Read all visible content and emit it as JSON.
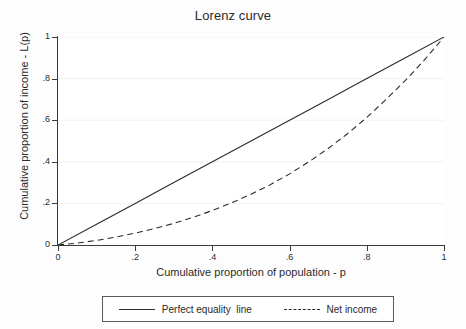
{
  "chart_data": {
    "type": "line",
    "title": "Lorenz curve",
    "xlabel": "Cumulative proportion of population - p",
    "ylabel": "Cumulative proportion of income - L(p)",
    "xlim": [
      0,
      1
    ],
    "ylim": [
      0,
      1
    ],
    "xticks": [
      "0",
      ".2",
      ".4",
      ".6",
      ".8",
      "1"
    ],
    "xtick_values": [
      0,
      0.2,
      0.4,
      0.6,
      0.8,
      1
    ],
    "yticks": [
      "0",
      ".2",
      ".4",
      ".6",
      ".8",
      "1"
    ],
    "ytick_values": [
      0,
      0.2,
      0.4,
      0.6,
      0.8,
      1
    ],
    "grid": "faint horizontal gridlines at y ticks",
    "legend_position": "below plot, outside, horizontal box",
    "series": [
      {
        "name": "Perfect equality line",
        "style": "solid",
        "color": "#2b2b2b",
        "x": [
          0,
          0.1,
          0.2,
          0.3,
          0.4,
          0.5,
          0.6,
          0.7,
          0.8,
          0.9,
          1
        ],
        "values": [
          0,
          0.1,
          0.2,
          0.3,
          0.4,
          0.5,
          0.6,
          0.7,
          0.8,
          0.9,
          1
        ]
      },
      {
        "name": "Net income",
        "style": "dashed",
        "color": "#2b2b2b",
        "x": [
          0,
          0.05,
          0.1,
          0.15,
          0.2,
          0.25,
          0.3,
          0.35,
          0.4,
          0.45,
          0.5,
          0.55,
          0.6,
          0.65,
          0.7,
          0.75,
          0.8,
          0.85,
          0.9,
          0.95,
          1
        ],
        "values": [
          0,
          0.009,
          0.022,
          0.038,
          0.057,
          0.079,
          0.104,
          0.133,
          0.166,
          0.203,
          0.244,
          0.29,
          0.342,
          0.4,
          0.464,
          0.535,
          0.613,
          0.7,
          0.791,
          0.891,
          1
        ]
      }
    ]
  },
  "legend": {
    "entries": [
      {
        "label": "Perfect equality  line",
        "style": "solid"
      },
      {
        "label": "Net income",
        "style": "dashed"
      }
    ]
  }
}
